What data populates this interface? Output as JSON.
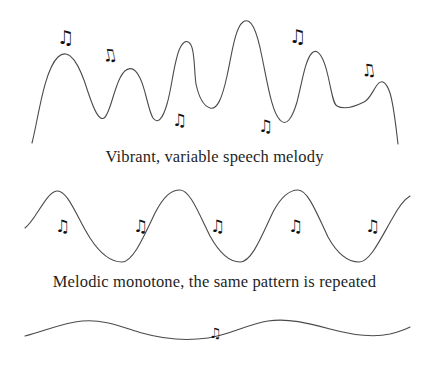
{
  "figure": {
    "title_alt": "Speech melody contour illustration",
    "background_color": "#ffffff",
    "stroke_color": "#4a4a4a",
    "text_color": "#1f1f1f",
    "note_color": "#111111"
  },
  "panels": [
    {
      "id": "vibrant-speech-melody",
      "caption": "Vibrant, variable speech melody",
      "wave_kind": "irregular-contour",
      "notes": [
        {
          "glyph": "♫",
          "x": 57,
          "y": 28,
          "size": "md",
          "rotate": 0
        },
        {
          "glyph": "♫",
          "x": 102,
          "y": 47,
          "size": "sm",
          "rotate": -12
        },
        {
          "glyph": "♫",
          "x": 172,
          "y": 112,
          "size": "sm",
          "rotate": 0
        },
        {
          "glyph": "♫",
          "x": 258,
          "y": 118,
          "size": "sm",
          "rotate": 0
        },
        {
          "glyph": "♫",
          "x": 289,
          "y": 27,
          "size": "md",
          "rotate": 0
        },
        {
          "glyph": "♫",
          "x": 361,
          "y": 62,
          "size": "sm",
          "rotate": -8
        }
      ]
    },
    {
      "id": "melodic-monotone",
      "caption": "Melodic monotone, the same pattern is repeated",
      "wave_kind": "regular-sine",
      "notes": [
        {
          "glyph": "♫",
          "x": 55,
          "y": 218,
          "size": "sm",
          "rotate": 0
        },
        {
          "glyph": "♫",
          "x": 133,
          "y": 218,
          "size": "sm",
          "rotate": 0
        },
        {
          "glyph": "♫",
          "x": 210,
          "y": 218,
          "size": "sm",
          "rotate": 0
        },
        {
          "glyph": "♫",
          "x": 288,
          "y": 218,
          "size": "sm",
          "rotate": 0
        },
        {
          "glyph": "♫",
          "x": 365,
          "y": 218,
          "size": "sm",
          "rotate": 0
        }
      ]
    },
    {
      "id": "flat-monotone",
      "caption": "",
      "wave_kind": "shallow-sine",
      "notes": [
        {
          "glyph": "♫",
          "x": 209,
          "y": 326,
          "size": "tiny",
          "rotate": 0
        }
      ]
    }
  ],
  "chart_data": {
    "type": "line",
    "xlabel": "",
    "ylabel": "Pitch",
    "grid": false,
    "legend": "none",
    "series": [
      {
        "name": "Vibrant, variable speech melody",
        "path": "M 32 143 C 38 120, 44 70, 58 57 C 70 46, 80 66, 88 92 C 94 110, 99 121, 104 118 C 110 114, 113 92, 120 78 C 126 66, 134 65, 140 78 C 146 90, 148 110, 153 118 C 158 125, 163 118, 167 104 C 172 88, 174 60, 180 48 C 184 40, 188 40, 191 45 C 195 52, 194 71, 196 84 C 199 98, 204 106, 210 108 C 217 110, 222 99, 227 76 C 232 53, 235 28, 243 22 C 251 16, 257 31, 262 57 C 268 86, 272 112, 280 120 C 286 127, 292 119, 297 102 C 302 83, 305 60, 312 53 C 318 47, 324 58, 328 76 C 332 93, 333 104, 337 106 C 344 110, 356 106, 364 102 C 370 99, 372 92, 377 85 C 381 79, 386 81, 390 93 C 394 106, 396 128, 398 144",
        "x_range": [
          32,
          398
        ],
        "y_range": [
          22,
          144
        ]
      },
      {
        "name": "Melodic monotone, the same pattern is repeated",
        "path": "M 25 228 C 36 220, 46 192, 57 191 C 68 190, 78 220, 90 238 C 101 255, 111 262, 122 262 C 133 262, 144 236, 155 213 C 164 196, 171 190, 180 190 C 190 190, 199 214, 210 236 C 220 254, 230 262, 240 262 C 252 262, 262 235, 273 212 C 282 195, 290 190, 298 190 C 308 190, 317 214, 328 237 C 338 255, 348 262, 359 262 C 370 262, 381 238, 392 219 C 399 206, 405 199, 410 196",
        "x_range": [
          25,
          410
        ],
        "y_range": [
          190,
          262
        ],
        "period_px": 120,
        "amplitude_px": 36
      },
      {
        "name": "Flat monotone",
        "path": "M 25 336 C 45 331, 62 323, 82 321 C 104 319, 122 327, 142 333 C 163 339, 186 341, 208 338 C 230 335, 248 324, 268 321 C 288 318, 308 323, 330 329 C 352 335, 372 338, 390 334 C 398 332, 404 330, 410 327",
        "x_range": [
          25,
          410
        ],
        "y_range": [
          318,
          341
        ],
        "amplitude_px": 9
      }
    ]
  }
}
